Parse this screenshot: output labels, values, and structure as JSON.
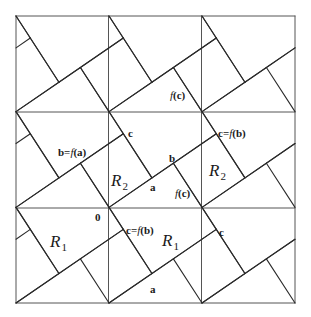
{
  "figure": {
    "grid": {
      "columns": 3,
      "rows": 3,
      "x_lines_px": [
        16,
        108.5,
        201.5,
        295
      ],
      "y_lines_px": [
        16,
        112,
        208,
        303
      ]
    },
    "tiling": {
      "tan_angle": 0.6667,
      "large_square_side_ratio": 0.832,
      "small_square_side_ratio": 0.5547
    },
    "colors": {
      "line": "#2b2b2b",
      "grid": "#555555",
      "background": "#ffffff"
    }
  },
  "labels": [
    {
      "id": "b-eq-f-a",
      "text": "b=f(a)",
      "x": 58,
      "y": 147,
      "kind": "small"
    },
    {
      "id": "c-top-mid",
      "text": "c",
      "x": 128,
      "y": 128,
      "kind": "small"
    },
    {
      "id": "f-c-top",
      "text": "f(c)",
      "x": 170,
      "y": 90,
      "kind": "small"
    },
    {
      "id": "c-eq-f-b-top",
      "text": "c=f(b)",
      "x": 218,
      "y": 128,
      "kind": "small"
    },
    {
      "id": "b-mid",
      "text": "b",
      "x": 169,
      "y": 153,
      "kind": "small"
    },
    {
      "id": "a-mid",
      "text": "a",
      "x": 150,
      "y": 182,
      "kind": "small"
    },
    {
      "id": "f-c-mid",
      "text": "f(c)",
      "x": 175,
      "y": 188,
      "kind": "small"
    },
    {
      "id": "zero",
      "text": "0",
      "x": 95,
      "y": 212,
      "kind": "small"
    },
    {
      "id": "c-eq-f-b-bottom",
      "text": "c=f(b)",
      "x": 126,
      "y": 225,
      "kind": "small"
    },
    {
      "id": "c-bottom-right",
      "text": "c",
      "x": 219,
      "y": 227,
      "kind": "small"
    },
    {
      "id": "a-bottom",
      "text": "a",
      "x": 150,
      "y": 284,
      "kind": "small"
    }
  ],
  "regions": [
    {
      "id": "R2-left",
      "name": "R",
      "sub": "2",
      "x": 111,
      "y": 172
    },
    {
      "id": "R2-right",
      "name": "R",
      "sub": "2",
      "x": 209,
      "y": 162
    },
    {
      "id": "R1-left",
      "name": "R",
      "sub": "1",
      "x": 50,
      "y": 233
    },
    {
      "id": "R1-right",
      "name": "R",
      "sub": "1",
      "x": 162,
      "y": 232
    }
  ]
}
